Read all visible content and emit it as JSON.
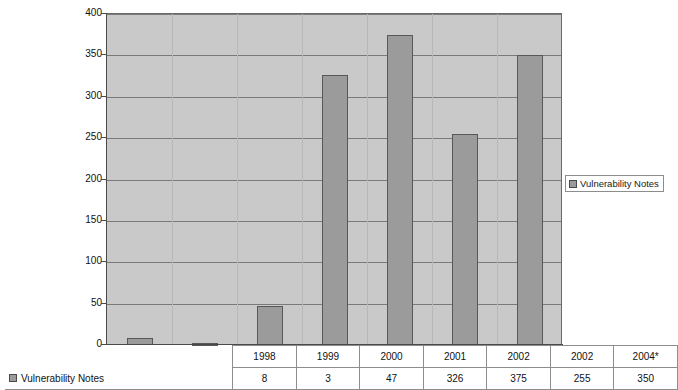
{
  "chart_data": {
    "type": "bar",
    "title": "",
    "xlabel": "",
    "ylabel": "",
    "categories": [
      "1998",
      "1999",
      "2000",
      "2001",
      "2002",
      "2002",
      "2004*"
    ],
    "values": [
      8,
      3,
      47,
      326,
      375,
      255,
      350
    ],
    "series": [
      {
        "name": "Vulnerability Notes",
        "values": [
          8,
          3,
          47,
          326,
          375,
          255,
          350
        ]
      }
    ],
    "ylim": [
      0,
      400
    ],
    "ytick_labels": [
      "0",
      "50",
      "100",
      "150",
      "200",
      "250",
      "300",
      "350",
      "400"
    ],
    "ytick_values": [
      0,
      50,
      100,
      150,
      200,
      250,
      300,
      350,
      400
    ],
    "grid": true,
    "legend_position": "right",
    "legend_entries": [
      "Vulnerability Notes"
    ],
    "bar_color": "#9b9b9b",
    "bar_border_color": "#585858",
    "plot_background": "#c9c9c9"
  },
  "legend": {
    "label": "Vulnerability Notes",
    "swatch_name": "series-swatch"
  },
  "table": {
    "row_label": "Vulnerability Notes",
    "headers": [
      "1998",
      "1999",
      "2000",
      "2001",
      "2002",
      "2002",
      "2004*"
    ],
    "values": [
      "8",
      "3",
      "47",
      "326",
      "375",
      "255",
      "350"
    ]
  }
}
